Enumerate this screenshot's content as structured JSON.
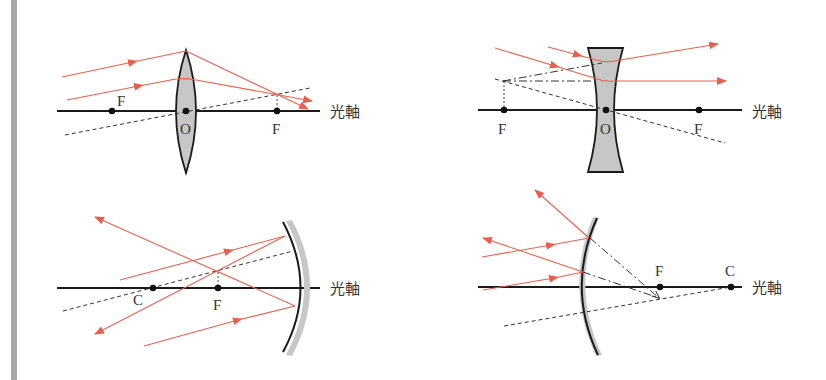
{
  "figure": {
    "colors": {
      "ray": "#e8604c",
      "axis": "#1a1a1a",
      "construction": "#333333",
      "glass": "#c8c8c8",
      "strip": "#a8a8a8"
    },
    "panels": [
      {
        "name": "convex-lens",
        "axis_label": "光軸",
        "points": {
          "focus_left": "F",
          "center": "O",
          "focus_right": "F"
        }
      },
      {
        "name": "concave-lens",
        "axis_label": "光軸",
        "points": {
          "focus_left": "F",
          "center": "O",
          "focus_right": "F"
        }
      },
      {
        "name": "concave-mirror",
        "axis_label": "光軸",
        "points": {
          "center_of_curvature": "C",
          "focus": "F"
        }
      },
      {
        "name": "convex-mirror",
        "axis_label": "光軸",
        "points": {
          "focus": "F",
          "center_of_curvature": "C"
        }
      }
    ]
  }
}
